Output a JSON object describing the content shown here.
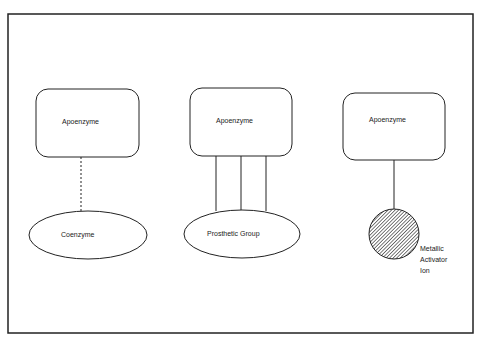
{
  "diagram": {
    "title": "",
    "colors": {
      "stroke": "#222222",
      "background": "#ffffff",
      "hatch": "#333333"
    },
    "groups": [
      {
        "apoenzyme_label": "Apoenzyme",
        "partner_label": "Coenzyme",
        "link_style": "dashed"
      },
      {
        "apoenzyme_label": "Apoenzyme",
        "partner_label": "Prosthetic Group",
        "link_style": "triple-solid"
      },
      {
        "apoenzyme_label": "Apoenzyme",
        "partner_label_lines": [
          "Metallic",
          "Activator",
          "Ion"
        ],
        "link_style": "solid",
        "partner_shape": "hatched-circle"
      }
    ]
  }
}
